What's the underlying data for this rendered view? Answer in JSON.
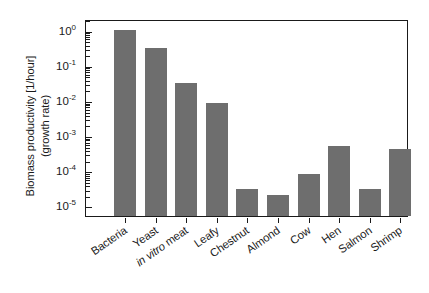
{
  "chart_data": {
    "type": "bar",
    "title": "",
    "xlabel": "",
    "ylabel_line1": "Biomass productivity [1/hour]",
    "ylabel_line2": "(growth rate)",
    "yscale": "log",
    "ylim": [
      5e-06,
      2.0
    ],
    "grid": false,
    "legend": "none",
    "bar_color": "#6e6e6e",
    "axis_color": "#1a1a1a",
    "categories": [
      "Bacteria",
      "Yeast",
      "in vitro meat",
      "Leafy",
      "Chestnut",
      "Almond",
      "Cow",
      "Hen",
      "Salmon",
      "Shrimp"
    ],
    "values": [
      1.0,
      0.3,
      0.03,
      0.008,
      3e-05,
      2e-05,
      8e-05,
      0.0005,
      3e-05,
      0.0004
    ],
    "ytick_labels": [
      "10⁰",
      "10⁻¹",
      "10⁻²",
      "10⁻³",
      "10⁻⁴",
      "10⁻⁵"
    ],
    "ytick_values": [
      1,
      0.1,
      0.01,
      0.001,
      0.0001,
      1e-05
    ],
    "ytick_mantissa": "10",
    "ytick_exponents": [
      "0",
      "-1",
      "-2",
      "-3",
      "-4",
      "-5"
    ]
  }
}
